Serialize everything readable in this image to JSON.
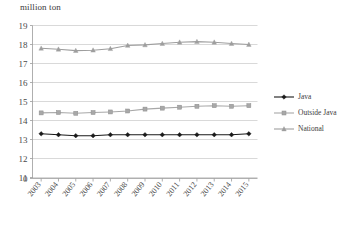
{
  "chart_data": {
    "type": "line",
    "title": "",
    "axis_unit_label": "million ton",
    "xlabel": "",
    "ylabel": "million ton",
    "grid": true,
    "legend_position": "right",
    "categories": [
      "2003",
      "2004",
      "2005",
      "2006",
      "2007",
      "2008",
      "2009",
      "2010",
      "2011",
      "2012",
      "2013",
      "2014",
      "2015"
    ],
    "ytick_labels": [
      "19",
      "18",
      "17",
      "16",
      "15",
      "14",
      "13",
      "12",
      "11",
      "0"
    ],
    "ylim": [
      11,
      19
    ],
    "y_axis_broken": true,
    "series": [
      {
        "name": "Java",
        "color": "#1a1a1a",
        "marker": "diamond",
        "values": [
          13.3,
          13.25,
          13.2,
          13.2,
          13.25,
          13.25,
          13.25,
          13.25,
          13.25,
          13.25,
          13.25,
          13.25,
          13.3
        ]
      },
      {
        "name": "Outside Java",
        "color": "#a8a8a8",
        "marker": "square",
        "values": [
          14.4,
          14.42,
          14.38,
          14.42,
          14.45,
          14.5,
          14.6,
          14.65,
          14.7,
          14.75,
          14.78,
          14.75,
          14.78
        ]
      },
      {
        "name": "National",
        "color": "#9e9e9e",
        "marker": "triangle",
        "values": [
          17.8,
          17.75,
          17.68,
          17.7,
          17.78,
          17.95,
          17.98,
          18.05,
          18.12,
          18.15,
          18.12,
          18.05,
          18.0
        ]
      }
    ]
  },
  "legend": {
    "items": [
      {
        "label": "Java"
      },
      {
        "label": "Outside Java"
      },
      {
        "label": "National"
      }
    ]
  }
}
